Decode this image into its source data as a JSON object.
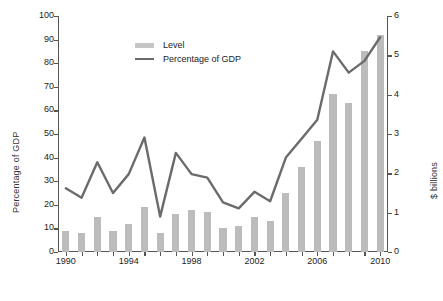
{
  "chart_data": {
    "type": "bar",
    "title": "",
    "xlabel": "",
    "ylabel": "Percentage of GDP",
    "y2label": "$ billions",
    "grid": false,
    "legend_position": "top-left",
    "x": [
      1990,
      1991,
      1992,
      1993,
      1994,
      1995,
      1996,
      1997,
      1998,
      1999,
      2000,
      2001,
      2002,
      2003,
      2004,
      2005,
      2006,
      2007,
      2008,
      2009,
      2010
    ],
    "xlim": [
      1989.5,
      2010.5
    ],
    "xtick_values": [
      1990,
      1991,
      1992,
      1993,
      1994,
      1995,
      1996,
      1997,
      1998,
      1999,
      2000,
      2001,
      2002,
      2003,
      2004,
      2005,
      2006,
      2007,
      2008,
      2009,
      2010
    ],
    "xtick_labels": [
      "1990",
      "",
      "",
      "",
      "1994",
      "",
      "",
      "",
      "1998",
      "",
      "",
      "",
      "2002",
      "",
      "",
      "",
      "2006",
      "",
      "",
      "",
      "2010"
    ],
    "ylim": [
      0,
      100
    ],
    "ytick_values": [
      0,
      10,
      20,
      30,
      40,
      50,
      60,
      70,
      80,
      90,
      100
    ],
    "ytick_labels": [
      "0",
      "10",
      "20",
      "30",
      "40",
      "50",
      "60",
      "70",
      "80",
      "90",
      "100"
    ],
    "y2lim": [
      0,
      6
    ],
    "y2tick_values": [
      0,
      1,
      2,
      3,
      4,
      5,
      6
    ],
    "y2tick_labels": [
      "0",
      "1",
      "2",
      "3",
      "4",
      "5",
      "6"
    ],
    "series": [
      {
        "name": "Level",
        "type": "bar",
        "axis": "right",
        "units": "$ billions",
        "color": "#bcbcbc",
        "values": [
          0.54,
          0.48,
          0.9,
          0.54,
          0.72,
          1.14,
          0.48,
          0.96,
          1.08,
          1.02,
          0.6,
          0.66,
          0.9,
          0.78,
          1.5,
          2.16,
          2.82,
          4.02,
          3.78,
          5.1,
          5.52
        ]
      },
      {
        "name": "Percentage of GDP",
        "type": "line",
        "axis": "left",
        "units": "percent",
        "color": "#6b6b6b",
        "values": [
          27,
          23,
          38,
          25,
          33,
          48.5,
          15,
          42,
          33,
          31.5,
          21,
          18.5,
          25.5,
          21.5,
          40,
          48,
          56,
          85,
          76,
          81,
          91
        ]
      }
    ]
  },
  "legend": {
    "items": [
      {
        "label": "Level",
        "marker": "bar-swatch"
      },
      {
        "label": "Percentage of GDP",
        "marker": "line-swatch"
      }
    ]
  },
  "caption": {
    "text": ""
  }
}
